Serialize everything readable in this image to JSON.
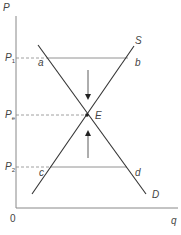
{
  "diagram": {
    "type": "supply-demand",
    "axes": {
      "y_label": "P",
      "x_label": "q",
      "origin_label": "0"
    },
    "price_levels": [
      {
        "id": "p1",
        "label": "P",
        "subscript": "1"
      },
      {
        "id": "pe",
        "label": "P",
        "subscript": "e"
      },
      {
        "id": "p2",
        "label": "P",
        "subscript": "2"
      }
    ],
    "curves": {
      "supply_label": "S",
      "demand_label": "D"
    },
    "points": {
      "a": "a",
      "b": "b",
      "c": "c",
      "d": "d",
      "equilibrium": "E"
    },
    "colors": {
      "line": "#333333",
      "text": "#444444",
      "dashed": "#888888",
      "background": "#ffffff"
    }
  }
}
